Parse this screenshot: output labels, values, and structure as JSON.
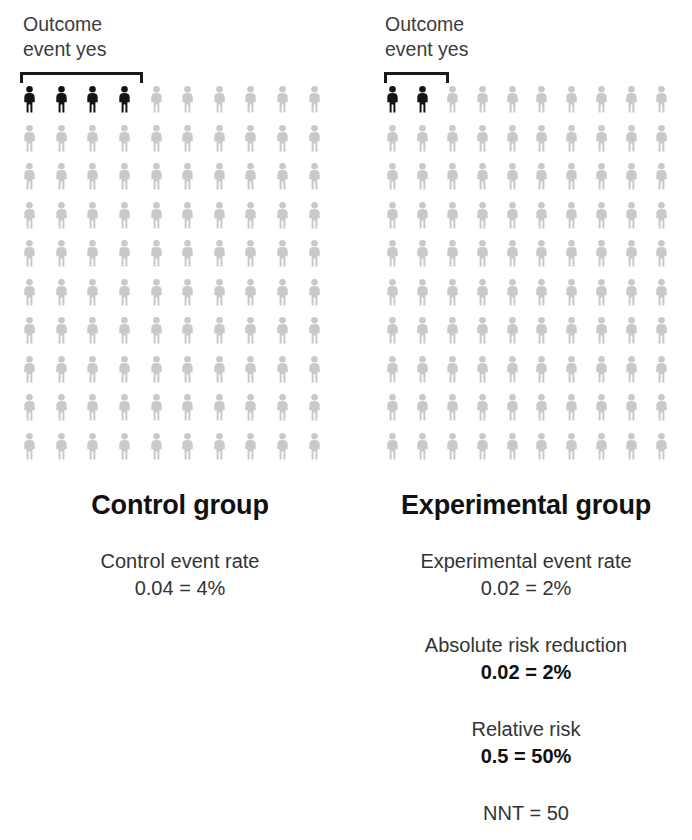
{
  "figure": {
    "background": "#ffffff",
    "highlight_color": "#131313",
    "muted_color": "#c9c9c9"
  },
  "chart_data": {
    "type": "pictogram",
    "title": "",
    "grid": {
      "columns": 10,
      "rows": 10,
      "total_per_group": 100
    },
    "groups": [
      {
        "key": "control",
        "title": "Control group",
        "bracket_label": "Outcome\nevent yes",
        "event_count": 4,
        "stats": [
          {
            "label": "Control event rate",
            "value": "0.04 = 4%",
            "bold_value": false
          }
        ]
      },
      {
        "key": "experimental",
        "title": "Experimental group",
        "bracket_label": "Outcome\nevent yes",
        "event_count": 2,
        "stats": [
          {
            "label": "Experimental event rate",
            "value": "0.02 = 2%",
            "bold_value": false
          },
          {
            "label": "Absolute risk reduction",
            "value": "0.02 = 2%",
            "bold_value": true
          },
          {
            "label": "Relative risk",
            "value": "0.5 = 50%",
            "bold_value": true
          },
          {
            "label": "",
            "value": "NNT = 50",
            "bold_value": false
          }
        ]
      }
    ]
  }
}
